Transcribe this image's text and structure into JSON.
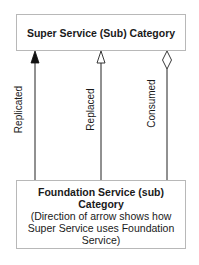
{
  "diagram": {
    "top_box": {
      "title": "Super Service (Sub) Category"
    },
    "bottom_box": {
      "title_line1": "Foundation Service (sub)",
      "title_line2": "Category",
      "note_line1": "(Direction of arrow shows how",
      "note_line2": "Super Service uses Foundation",
      "note_line3": "Service)"
    },
    "connectors": [
      {
        "label": "Replicated",
        "head": "filled-triangle"
      },
      {
        "label": "Replaced",
        "head": "open-triangle"
      },
      {
        "label": "Consumed",
        "head": "open-diamond"
      }
    ],
    "colors": {
      "line": "#222222",
      "box_border": "#b8b8b8",
      "background": "#ffffff"
    }
  }
}
